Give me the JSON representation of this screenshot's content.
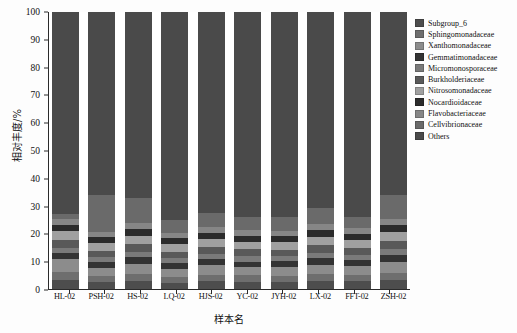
{
  "chart_data": {
    "type": "bar",
    "stacked": true,
    "title": "",
    "xlabel": "样本名",
    "ylabel": "相对丰度/%",
    "ylim": [
      0,
      100
    ],
    "yticks": [
      0,
      10,
      20,
      30,
      40,
      50,
      60,
      70,
      80,
      90,
      100
    ],
    "grid": false,
    "legend_position": "right",
    "categories": [
      "HL-02",
      "PSH-02",
      "HS-02",
      "LQ-02",
      "HJS-02",
      "YC-02",
      "JYH-02",
      "LX-02",
      "FFT-02",
      "ZSH-02"
    ],
    "series": [
      {
        "name": "Subgroup_6",
        "color": "#4d4d4d",
        "values": [
          3.4,
          2.6,
          2.9,
          2.2,
          3.0,
          2.7,
          2.6,
          3.1,
          2.8,
          3.3
        ]
      },
      {
        "name": "Sphingomonadaceae",
        "color": "#6e6e6e",
        "values": [
          2.6,
          2.1,
          2.4,
          2.0,
          2.3,
          2.2,
          2.1,
          2.5,
          2.2,
          2.6
        ]
      },
      {
        "name": "Xanthomonadaceae",
        "color": "#8c8c8c",
        "values": [
          4.8,
          2.9,
          3.6,
          3.1,
          3.4,
          3.0,
          3.2,
          3.4,
          3.3,
          4.0
        ]
      },
      {
        "name": "Gemmatimonadaceae",
        "color": "#333333",
        "values": [
          2.2,
          2.0,
          2.5,
          2.1,
          2.2,
          2.0,
          2.1,
          2.3,
          2.2,
          2.4
        ]
      },
      {
        "name": "Micromonosporaceae",
        "color": "#7a7a7a",
        "values": [
          1.9,
          1.8,
          2.1,
          1.8,
          2.0,
          1.9,
          1.8,
          2.0,
          1.9,
          2.1
        ]
      },
      {
        "name": "Burkholderiaceae",
        "color": "#595959",
        "values": [
          2.9,
          2.4,
          2.7,
          2.3,
          2.6,
          2.5,
          2.4,
          2.8,
          2.5,
          2.9
        ]
      },
      {
        "name": "Nitrosomonadaceae",
        "color": "#a0a0a0",
        "values": [
          3.1,
          2.8,
          3.0,
          2.6,
          2.9,
          2.7,
          2.8,
          3.0,
          2.8,
          3.2
        ]
      },
      {
        "name": "Nocardioidaceae",
        "color": "#2b2b2b",
        "values": [
          2.4,
          2.2,
          2.6,
          2.2,
          2.4,
          2.3,
          2.2,
          2.6,
          2.3,
          2.5
        ]
      },
      {
        "name": "Flavobacteriaceae",
        "color": "#868686",
        "values": [
          2.0,
          1.9,
          2.2,
          1.9,
          2.1,
          2.0,
          1.9,
          2.2,
          2.0,
          2.2
        ]
      },
      {
        "name": "Cellvibrionaceae",
        "color": "#6a6a6a",
        "values": [
          1.7,
          13.3,
          9.0,
          4.8,
          5.1,
          4.7,
          4.9,
          6.1,
          4.0,
          8.8
        ]
      },
      {
        "name": "Others",
        "color": "#4a4a4a",
        "values": [
          73.0,
          66.0,
          67.0,
          75.0,
          74.0,
          74.0,
          74.0,
          72.0,
          74.0,
          66.0
        ]
      }
    ]
  },
  "legend": {
    "items": [
      {
        "label": "Subgroup_6"
      },
      {
        "label": "Sphingomonadaceae"
      },
      {
        "label": "Xanthomonadaceae"
      },
      {
        "label": "Gemmatimonadaceae"
      },
      {
        "label": "Micromonosporaceae"
      },
      {
        "label": "Burkholderiaceae"
      },
      {
        "label": "Nitrosomonadaceae"
      },
      {
        "label": "Nocardioidaceae"
      },
      {
        "label": "Flavobacteriaceae"
      },
      {
        "label": "Cellvibrionaceae"
      },
      {
        "label": "Others"
      }
    ]
  }
}
